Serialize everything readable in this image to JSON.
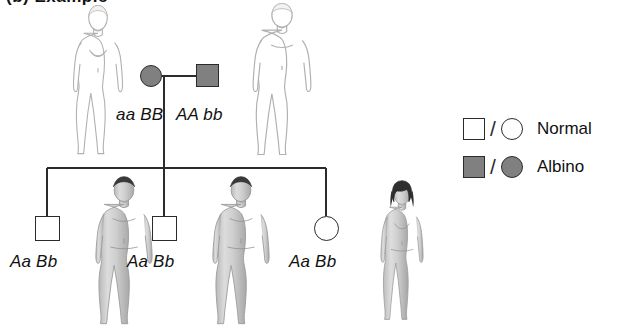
{
  "figure": {
    "caption": "(b)  Example",
    "type": "pedigree",
    "trait": "albinism",
    "colors": {
      "affected_fill": "#808080",
      "unaffected_fill": "#ffffff",
      "stroke": "#2b2b2b",
      "background": "#ffffff"
    }
  },
  "generations": [
    {
      "id": "parents",
      "label": "parent-generation",
      "members": [
        {
          "id": "mother",
          "sex": "female",
          "shape": "circle",
          "status": "affected",
          "phenotype": "Albino",
          "genotype": "aa BB",
          "x": 151,
          "y": 76,
          "size": 22
        },
        {
          "id": "father",
          "sex": "male",
          "shape": "square",
          "status": "affected",
          "phenotype": "Albino",
          "genotype": "AA bb",
          "x": 196,
          "y": 76,
          "size": 23
        }
      ]
    },
    {
      "id": "children",
      "label": "offspring-generation",
      "members": [
        {
          "id": "child-1",
          "sex": "male",
          "shape": "square",
          "status": "unaffected",
          "phenotype": "Normal",
          "genotype": "Aa Bb",
          "x": 47,
          "y": 228,
          "size": 25
        },
        {
          "id": "child-2",
          "sex": "male",
          "shape": "square",
          "status": "unaffected",
          "phenotype": "Normal",
          "genotype": "Aa Bb",
          "x": 164,
          "y": 228,
          "size": 25
        },
        {
          "id": "child-3",
          "sex": "female",
          "shape": "circle",
          "status": "unaffected",
          "phenotype": "Normal",
          "genotype": "Aa Bb",
          "x": 326,
          "y": 228,
          "size": 25
        }
      ]
    }
  ],
  "genotype_labels": [
    {
      "id": "mother-genotype",
      "text": "aa BB",
      "x": 116,
      "y": 105
    },
    {
      "id": "father-genotype",
      "text": "AA bb",
      "x": 176,
      "y": 105
    },
    {
      "id": "child-1-genotype",
      "text": "Aa Bb",
      "x": 10,
      "y": 252
    },
    {
      "id": "child-2-genotype",
      "text": "Aa Bb",
      "x": 127,
      "y": 252
    },
    {
      "id": "child-3-genotype",
      "text": "Aa Bb",
      "x": 289,
      "y": 252
    }
  ],
  "legend": {
    "title": "",
    "separator": "/",
    "items": [
      {
        "id": "legend-normal",
        "label": "Normal",
        "square_fill": "#ffffff",
        "circle_fill": "#ffffff",
        "status": "unaffected",
        "x": 463,
        "y": 114
      },
      {
        "id": "legend-albino",
        "label": "Albino",
        "square_fill": "#808080",
        "circle_fill": "#808080",
        "status": "affected",
        "x": 463,
        "y": 152
      }
    ]
  },
  "illustrations": [
    {
      "id": "figure-albino-female",
      "description": "albino-woman-outline",
      "pigmented": false,
      "sex": "female",
      "x": 62,
      "y": 4,
      "width": 72,
      "height": 160
    },
    {
      "id": "figure-albino-male",
      "description": "albino-man-outline",
      "pigmented": false,
      "sex": "male",
      "x": 243,
      "y": 2,
      "width": 78,
      "height": 162
    },
    {
      "id": "figure-normal-male-1",
      "description": "pigmented-man-shaded",
      "pigmented": true,
      "sex": "male",
      "x": 86,
      "y": 176,
      "width": 76,
      "height": 156
    },
    {
      "id": "figure-normal-male-2",
      "description": "pigmented-man-shaded",
      "pigmented": true,
      "sex": "male",
      "x": 203,
      "y": 176,
      "width": 76,
      "height": 156
    },
    {
      "id": "figure-normal-female",
      "description": "pigmented-woman-shaded",
      "pigmented": true,
      "sex": "female",
      "x": 371,
      "y": 180,
      "width": 62,
      "height": 150
    }
  ],
  "connectors": {
    "mating_line": {
      "x1": 162,
      "y1": 76,
      "x2": 196,
      "y2": 76
    },
    "descent_line": {
      "x1": 164,
      "y1": 76,
      "x2": 164,
      "y2": 228
    },
    "sibship_line": {
      "x1": 47,
      "y1": 168,
      "x2": 326,
      "y2": 168
    },
    "drops": [
      {
        "id": "drop-child-1",
        "x": 47,
        "y1": 168,
        "y2": 216
      },
      {
        "id": "drop-child-2",
        "x": 164,
        "y1": 168,
        "y2": 216
      },
      {
        "id": "drop-child-3",
        "x": 326,
        "y1": 168,
        "y2": 216
      }
    ]
  }
}
